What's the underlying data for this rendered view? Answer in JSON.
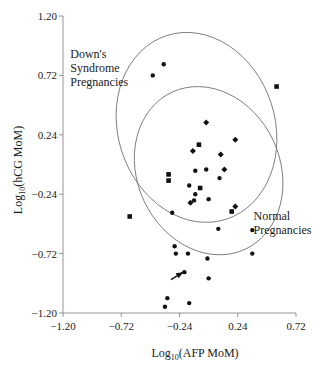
{
  "chart_data": {
    "type": "scatter",
    "title": "",
    "xlabel": "Log10(AFP MoM)",
    "xlabel_main": "Log",
    "xlabel_sub": "10",
    "xlabel_rest": "(AFP MoM)",
    "ylabel": "Log10(hCG MoM)",
    "ylabel_main": "Log",
    "ylabel_sub": "10",
    "ylabel_rest": "(hCG MoM)",
    "xlim": [
      -1.2,
      0.72
    ],
    "ylim": [
      -1.2,
      1.2
    ],
    "xticks": [
      "-1.20",
      "-0.72",
      "-0.24",
      "0.24",
      "0.72"
    ],
    "xtick_values": [
      -1.2,
      -0.72,
      -0.24,
      0.24,
      0.72
    ],
    "yticks": [
      "1.20",
      "0.72",
      "0.24",
      "-0.24",
      "-0.72",
      "-1.20"
    ],
    "ytick_values": [
      1.2,
      0.72,
      0.24,
      -0.24,
      -0.72,
      -1.2
    ],
    "grid": false,
    "legend": null,
    "annotations": [
      {
        "lines": [
          "Down's",
          "Syndrome",
          "Pregnancies"
        ],
        "x": -1.14,
        "y": 0.86
      },
      {
        "lines": [
          "Normal",
          "Pregnancies"
        ],
        "x": 0.37,
        "y": -0.45
      }
    ],
    "ellipses": [
      {
        "name": "Down's Syndrome Pregnancies",
        "cx": -0.1,
        "cy": 0.3,
        "rx": 0.66,
        "ry": 0.78,
        "rotate_deg": 18
      },
      {
        "name": "Normal Pregnancies",
        "cx": 0.0,
        "cy": -0.05,
        "rx": 0.6,
        "ry": 0.7,
        "rotate_deg": 25
      }
    ],
    "arrow": {
      "from": [
        -0.31,
        -0.93
      ],
      "to": [
        -0.21,
        -0.87
      ]
    },
    "series": [
      {
        "name": "dot",
        "marker": "circle",
        "points": [
          [
            -0.37,
            0.81
          ],
          [
            -0.46,
            0.72
          ],
          [
            -0.11,
            -0.05
          ],
          [
            -0.02,
            -0.04
          ],
          [
            0.09,
            -0.11
          ],
          [
            -0.16,
            -0.17
          ],
          [
            -0.11,
            -0.24
          ],
          [
            -0.12,
            -0.29
          ],
          [
            0.0,
            -0.28
          ],
          [
            -0.3,
            -0.39
          ],
          [
            0.08,
            -0.52
          ],
          [
            0.36,
            -0.53
          ],
          [
            -0.28,
            -0.66
          ],
          [
            -0.27,
            -0.72
          ],
          [
            -0.17,
            -0.72
          ],
          [
            0.36,
            -0.72
          ],
          [
            -0.01,
            -0.76
          ],
          [
            -0.2,
            -0.87
          ],
          [
            0.0,
            -0.92
          ],
          [
            -0.34,
            -1.08
          ],
          [
            -0.36,
            -1.15
          ],
          [
            -0.16,
            -1.12
          ]
        ]
      },
      {
        "name": "square",
        "marker": "square",
        "points": [
          [
            0.56,
            0.63
          ],
          [
            -0.08,
            0.16
          ],
          [
            -0.33,
            -0.08
          ],
          [
            -0.33,
            -0.13
          ],
          [
            -0.07,
            -0.19
          ],
          [
            0.19,
            -0.38
          ],
          [
            -0.65,
            -0.42
          ]
        ]
      },
      {
        "name": "diamond",
        "marker": "diamond",
        "points": [
          [
            -0.02,
            0.34
          ],
          [
            0.22,
            0.2
          ],
          [
            -0.13,
            0.11
          ],
          [
            0.1,
            0.08
          ],
          [
            0.13,
            -0.04
          ],
          [
            -0.15,
            -0.31
          ],
          [
            0.22,
            -0.34
          ]
        ]
      }
    ]
  }
}
